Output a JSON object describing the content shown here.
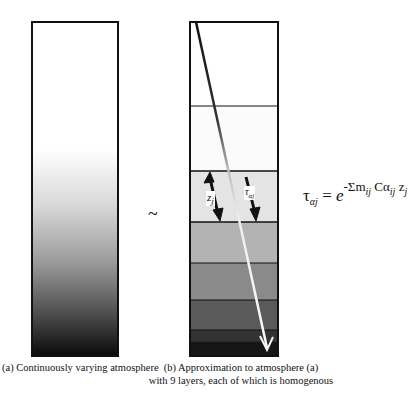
{
  "panel_a": {
    "caption": "(a)  Continuously varying atmosphere",
    "box": {
      "x": 32,
      "y": 22,
      "w": 86,
      "h": 334
    }
  },
  "panel_b": {
    "caption_line1": "(b)  Approximation to atmosphere (a)",
    "caption_line2": "with 9 layers, each of which is homogenous",
    "box": {
      "x": 190,
      "y": 22,
      "w": 88,
      "h": 334
    },
    "layer_count": 9,
    "layer_boundaries_y": [
      106,
      171,
      222,
      263,
      300,
      330,
      342,
      349
    ],
    "labels": {
      "z": "z",
      "z_sub": "j",
      "tau": "τ",
      "tau_sub": "αj"
    }
  },
  "relation_symbol": "~",
  "formula": {
    "lhs": "τ",
    "lhs_sub": "αj",
    "equals": " = ",
    "base": "e",
    "exponent": "-Σm",
    "exponent_sub1": "ij",
    "exponent_mid": " Cα",
    "exponent_sub2": "ij",
    "exponent_end": " z",
    "exponent_sub3": "j"
  },
  "colors": {
    "stroke": "#111111",
    "background": "#ffffff",
    "ray_light": "#f5f5f5"
  }
}
